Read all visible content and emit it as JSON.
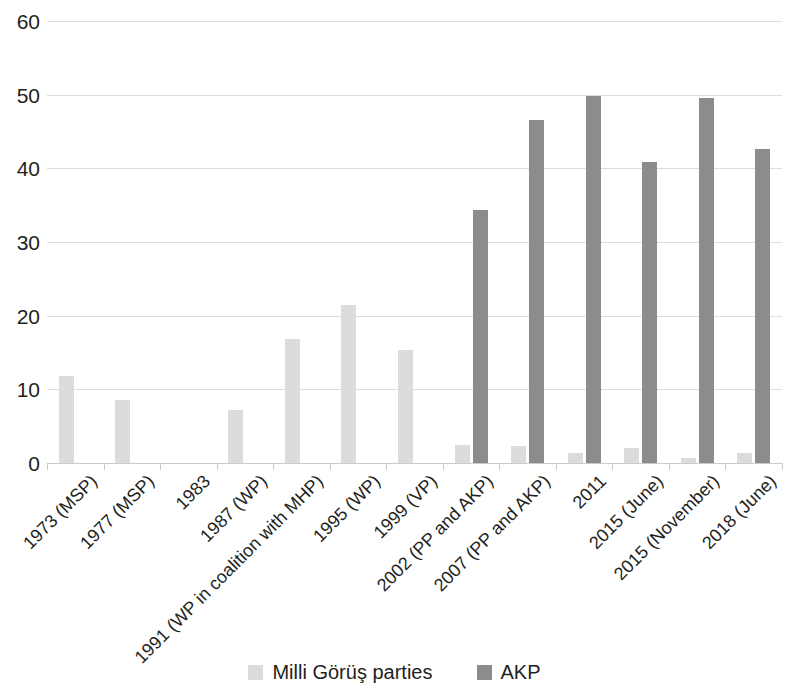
{
  "chart_data": {
    "type": "bar",
    "title": "",
    "subtitle": "",
    "xlabel": "",
    "ylabel": "",
    "ylim": [
      0,
      60
    ],
    "ytick_labels": [
      "60",
      "50",
      "40",
      "30",
      "20",
      "10",
      "0"
    ],
    "ytick_values": [
      60,
      50,
      40,
      30,
      20,
      10,
      0
    ],
    "grid": true,
    "legend_position": "bottom",
    "categories": [
      "1973 (MSP)",
      "1977 (MSP)",
      "1983",
      "1987 (WP)",
      "1991 (WP in coalition with MHP)",
      "1995 (WP)",
      "1999 (VP)",
      "2002 (PP and AKP)",
      "2007 (PP and AKP)",
      "2011",
      "2015 (June)",
      "2015 (November)",
      "2018 (June)"
    ],
    "series": [
      {
        "name": "Milli Görüş parties",
        "color": "#dcdcdc",
        "values": [
          11.8,
          8.6,
          0,
          7.2,
          16.9,
          21.4,
          15.4,
          2.5,
          2.3,
          1.3,
          2.0,
          0.7,
          1.3
        ]
      },
      {
        "name": "AKP",
        "color": "#8c8c8c",
        "values": [
          0,
          0,
          0,
          0,
          0,
          0,
          0,
          34.3,
          46.6,
          49.8,
          40.9,
          49.5,
          42.6
        ]
      }
    ]
  },
  "legend": {
    "items": [
      {
        "label": "Milli Görüş parties",
        "color": "#dcdcdc"
      },
      {
        "label": "AKP",
        "color": "#8c8c8c"
      }
    ]
  }
}
